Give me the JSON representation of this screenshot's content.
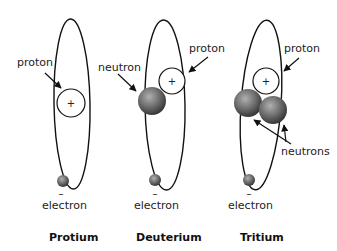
{
  "diagram": {
    "type": "hydrogen-isotopes",
    "atoms": [
      {
        "name": "Protium",
        "labels": {
          "proton": "proton",
          "electron": "electron"
        },
        "proton_sign": "+",
        "electron_sign": "–",
        "neutron_count": 0
      },
      {
        "name": "Deuterium",
        "labels": {
          "proton": "proton",
          "neutron": "neutron",
          "electron": "electron"
        },
        "proton_sign": "+",
        "electron_sign": "–",
        "neutron_count": 1
      },
      {
        "name": "Tritium",
        "labels": {
          "proton": "proton",
          "neutrons": "neutrons",
          "electron": "electron"
        },
        "proton_sign": "+",
        "electron_sign": "–",
        "neutron_count": 2
      }
    ],
    "colors": {
      "line": "#111111",
      "particle_dark": "#3a3a3a",
      "particle_light": "#a8a8a8",
      "background": "#ffffff"
    }
  }
}
